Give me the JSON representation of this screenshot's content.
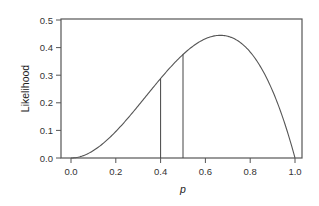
{
  "chart_data": {
    "type": "line",
    "title": "",
    "xlabel": "p",
    "ylabel": "Likelihood",
    "xlim": [
      0.0,
      1.0
    ],
    "ylim": [
      0.0,
      0.5
    ],
    "xticks": [
      "0.0",
      "0.2",
      "0.4",
      "0.6",
      "0.8",
      "1.0"
    ],
    "yticks": [
      "0.0",
      "0.1",
      "0.2",
      "0.3",
      "0.4",
      "0.5"
    ],
    "grid": false,
    "legend": null,
    "series": [
      {
        "name": "Likelihood L(p) = 3p^2(1-p)",
        "x": [
          0.0,
          0.1,
          0.2,
          0.3,
          0.4,
          0.5,
          0.6,
          0.667,
          0.7,
          0.8,
          0.9,
          1.0
        ],
        "y": [
          0.0,
          0.027,
          0.096,
          0.189,
          0.288,
          0.375,
          0.432,
          0.444,
          0.441,
          0.384,
          0.243,
          0.0
        ]
      }
    ],
    "annotations": [
      {
        "type": "vertical-line",
        "x": 0.4,
        "y_top": 0.288
      },
      {
        "type": "vertical-line",
        "x": 0.5,
        "y_top": 0.375
      }
    ]
  }
}
